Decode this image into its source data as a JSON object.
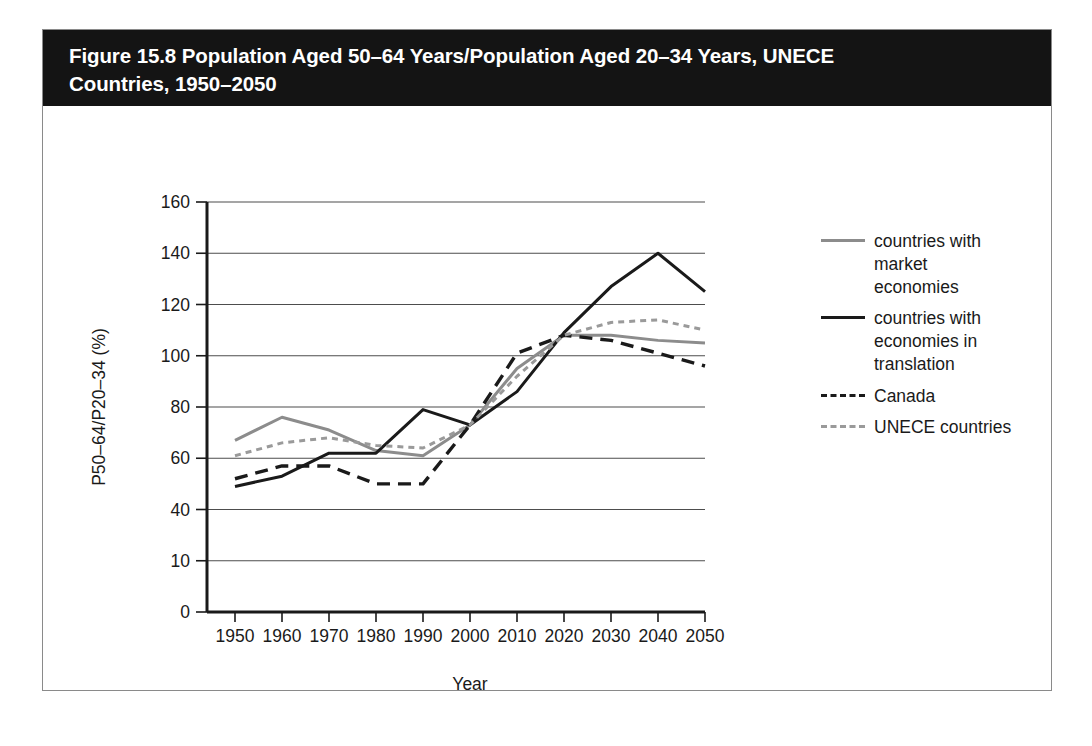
{
  "figure": {
    "title": "Figure 15.8 Population Aged 50–64 Years/Population Aged 20–34 Years, UNECE\nCountries, 1950–2050",
    "title_bar_color": "#141414",
    "border_color": "#8a8a8a"
  },
  "legend": {
    "position": "right",
    "items": [
      {
        "label": "countries with market\neconomies",
        "style": "solid",
        "color": "#8c8c8c"
      },
      {
        "label": "countries with\neconomies in translation",
        "style": "solid",
        "color": "#1a1a1a"
      },
      {
        "label": "Canada",
        "style": "dashed",
        "color": "#1a1a1a"
      },
      {
        "label": "UNECE countries",
        "style": "dotted",
        "color": "#9a9a9a"
      }
    ]
  },
  "chart_data": {
    "type": "line",
    "title": "Figure 15.8 Population Aged 50–64 Years/Population Aged 20–34 Years, UNECE Countries, 1950–2050",
    "xlabel": "Year",
    "ylabel": "P50–64/P20–34 (%)",
    "categories": [
      1950,
      1960,
      1970,
      1980,
      1990,
      2000,
      2010,
      2020,
      2030,
      2040,
      2050
    ],
    "x_tick_labels": [
      "1950",
      "1960",
      "1970",
      "1980",
      "1990",
      "2000",
      "2010",
      "2020",
      "2030",
      "2040",
      "2050"
    ],
    "y_tick_labels": [
      "0",
      "10",
      "40",
      "60",
      "80",
      "100",
      "120",
      "140",
      "160"
    ],
    "y_tick_positions": [
      0,
      20,
      40,
      60,
      80,
      100,
      120,
      140,
      160
    ],
    "ylim": [
      0,
      160
    ],
    "xlim": [
      1950,
      2050
    ],
    "grid": "horizontal",
    "legend_position": "right",
    "series": [
      {
        "name": "countries with market economies",
        "color": "#8c8c8c",
        "style": "solid",
        "values": [
          67,
          76,
          71,
          63,
          61,
          73,
          95,
          108,
          108,
          106,
          105
        ]
      },
      {
        "name": "countries with economies in translation",
        "color": "#1a1a1a",
        "style": "solid",
        "values": [
          49,
          53,
          62,
          62,
          79,
          73,
          86,
          109,
          127,
          140,
          125
        ]
      },
      {
        "name": "Canada",
        "color": "#1a1a1a",
        "style": "dashed",
        "values": [
          52,
          57,
          57,
          50,
          50,
          73,
          101,
          108,
          106,
          101,
          96
        ]
      },
      {
        "name": "UNECE countries",
        "color": "#9a9a9a",
        "style": "dotted",
        "values": [
          61,
          66,
          68,
          65,
          64,
          73,
          92,
          108,
          113,
          114,
          110
        ]
      }
    ]
  }
}
